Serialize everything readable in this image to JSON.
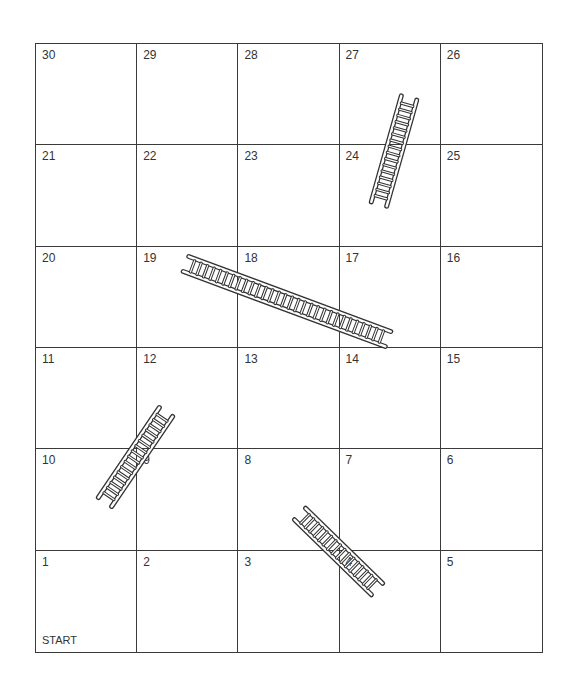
{
  "board": {
    "rows": [
      [
        "30",
        "29",
        "28",
        "27",
        "26"
      ],
      [
        "21",
        "22",
        "23",
        "24",
        "25"
      ],
      [
        "20",
        "19",
        "18",
        "17",
        "16"
      ],
      [
        "11",
        "12",
        "13",
        "14",
        "15"
      ],
      [
        "10",
        "9",
        "8",
        "7",
        "6"
      ],
      [
        "1",
        "2",
        "3",
        "4",
        "5"
      ]
    ],
    "start_label": "START",
    "line_color": "#3a3a3a"
  },
  "ladders": [
    {
      "name": "ladder-24-27",
      "from": "24",
      "to": "27"
    },
    {
      "name": "ladder-19-17",
      "from": "19",
      "to": "17"
    },
    {
      "name": "ladder-10-12",
      "from": "10",
      "to": "12"
    },
    {
      "name": "ladder-4-8",
      "from": "4",
      "to": "8"
    }
  ]
}
